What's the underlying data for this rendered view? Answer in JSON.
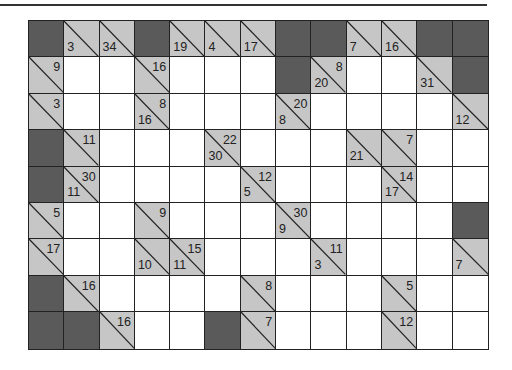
{
  "puzzle": {
    "type": "kakuro",
    "cols": 13,
    "rows": 9,
    "cell_types_legend": {
      "D": "dark/blocked",
      "W": "white/entry",
      "C": "clue"
    },
    "colors": {
      "dark": "#5a5a5a",
      "clue": "#c6c6c6",
      "white": "#ffffff",
      "line": "#222222"
    },
    "grid": [
      [
        {
          "t": "D"
        },
        {
          "t": "C",
          "down": "3"
        },
        {
          "t": "C",
          "down": "34"
        },
        {
          "t": "D"
        },
        {
          "t": "C",
          "down": "19"
        },
        {
          "t": "C",
          "down": "4"
        },
        {
          "t": "C",
          "down": "17"
        },
        {
          "t": "D"
        },
        {
          "t": "D"
        },
        {
          "t": "C",
          "down": "7"
        },
        {
          "t": "C",
          "down": "16"
        },
        {
          "t": "D"
        },
        {
          "t": "D"
        }
      ],
      [
        {
          "t": "C",
          "across": "9"
        },
        {
          "t": "W"
        },
        {
          "t": "W"
        },
        {
          "t": "C",
          "across": "16"
        },
        {
          "t": "W"
        },
        {
          "t": "W"
        },
        {
          "t": "W"
        },
        {
          "t": "D"
        },
        {
          "t": "C",
          "down": "20",
          "across": "8"
        },
        {
          "t": "W"
        },
        {
          "t": "W"
        },
        {
          "t": "C",
          "down": "31"
        },
        {
          "t": "D"
        }
      ],
      [
        {
          "t": "C",
          "across": "3"
        },
        {
          "t": "W"
        },
        {
          "t": "W"
        },
        {
          "t": "C",
          "down": "16",
          "across": "8"
        },
        {
          "t": "W"
        },
        {
          "t": "W"
        },
        {
          "t": "W"
        },
        {
          "t": "C",
          "down": "8",
          "across": "20"
        },
        {
          "t": "W"
        },
        {
          "t": "W"
        },
        {
          "t": "W"
        },
        {
          "t": "W"
        },
        {
          "t": "C",
          "down": "12"
        }
      ],
      [
        {
          "t": "D"
        },
        {
          "t": "C",
          "across": "11"
        },
        {
          "t": "W"
        },
        {
          "t": "W"
        },
        {
          "t": "W"
        },
        {
          "t": "C",
          "down": "30",
          "across": "22"
        },
        {
          "t": "W"
        },
        {
          "t": "W"
        },
        {
          "t": "W"
        },
        {
          "t": "C",
          "down": "21"
        },
        {
          "t": "C",
          "across": "7"
        },
        {
          "t": "W"
        },
        {
          "t": "W"
        }
      ],
      [
        {
          "t": "D"
        },
        {
          "t": "C",
          "down": "11",
          "across": "30"
        },
        {
          "t": "W"
        },
        {
          "t": "W"
        },
        {
          "t": "W"
        },
        {
          "t": "W"
        },
        {
          "t": "C",
          "down": "5",
          "across": "12"
        },
        {
          "t": "W"
        },
        {
          "t": "W"
        },
        {
          "t": "W"
        },
        {
          "t": "C",
          "down": "17",
          "across": "14"
        },
        {
          "t": "W"
        },
        {
          "t": "W"
        }
      ],
      [
        {
          "t": "C",
          "across": "5"
        },
        {
          "t": "W"
        },
        {
          "t": "W"
        },
        {
          "t": "C",
          "across": "9"
        },
        {
          "t": "W"
        },
        {
          "t": "W"
        },
        {
          "t": "W"
        },
        {
          "t": "C",
          "down": "9",
          "across": "30"
        },
        {
          "t": "W"
        },
        {
          "t": "W"
        },
        {
          "t": "W"
        },
        {
          "t": "W"
        },
        {
          "t": "D"
        }
      ],
      [
        {
          "t": "C",
          "across": "17"
        },
        {
          "t": "W"
        },
        {
          "t": "W"
        },
        {
          "t": "C",
          "down": "10"
        },
        {
          "t": "C",
          "down": "11",
          "across": "15"
        },
        {
          "t": "W"
        },
        {
          "t": "W"
        },
        {
          "t": "W"
        },
        {
          "t": "C",
          "down": "3",
          "across": "11"
        },
        {
          "t": "W"
        },
        {
          "t": "W"
        },
        {
          "t": "W"
        },
        {
          "t": "C",
          "down": "7"
        }
      ],
      [
        {
          "t": "D"
        },
        {
          "t": "C",
          "across": "16"
        },
        {
          "t": "W"
        },
        {
          "t": "W"
        },
        {
          "t": "W"
        },
        {
          "t": "W"
        },
        {
          "t": "C",
          "across": "8"
        },
        {
          "t": "W"
        },
        {
          "t": "W"
        },
        {
          "t": "W"
        },
        {
          "t": "C",
          "across": "5"
        },
        {
          "t": "W"
        },
        {
          "t": "W"
        }
      ],
      [
        {
          "t": "D"
        },
        {
          "t": "D"
        },
        {
          "t": "C",
          "across": "16"
        },
        {
          "t": "W"
        },
        {
          "t": "W"
        },
        {
          "t": "D"
        },
        {
          "t": "C",
          "across": "7"
        },
        {
          "t": "W"
        },
        {
          "t": "W"
        },
        {
          "t": "W"
        },
        {
          "t": "C",
          "across": "12"
        },
        {
          "t": "W"
        },
        {
          "t": "W"
        }
      ]
    ]
  }
}
